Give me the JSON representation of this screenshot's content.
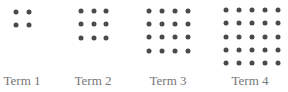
{
  "dot_color": "#4a4a4a",
  "label_color": "#777777",
  "terms": [
    {
      "label": "Term 1",
      "size": 2,
      "label_x": 22,
      "xs": [
        16,
        29
      ],
      "ys": [
        12,
        25
      ]
    },
    {
      "label": "Term 2",
      "size": 3,
      "label_x": 93,
      "xs": [
        81,
        94,
        106
      ],
      "ys": [
        11,
        24,
        38
      ]
    },
    {
      "label": "Term 3",
      "size": 4,
      "label_x": 168,
      "xs": [
        149,
        162,
        175,
        188
      ],
      "ys": [
        11,
        24,
        37,
        51
      ]
    },
    {
      "label": "Term 4",
      "size": 5,
      "label_x": 250,
      "xs": [
        226,
        239,
        252,
        265,
        278
      ],
      "ys": [
        10,
        23,
        37,
        50,
        63
      ]
    }
  ]
}
